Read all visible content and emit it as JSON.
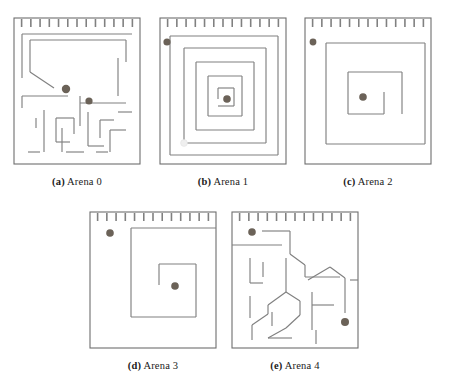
{
  "figure": {
    "background_color": "#ffffff",
    "wall_color": "#808080",
    "border_color": "#6e6e6e",
    "agent_color": "#6b6258",
    "goal_color": "#efefef",
    "rows": [
      {
        "cells": [
          "arena0",
          "arena1",
          "arena2"
        ]
      },
      {
        "cells": [
          "arena3",
          "arena4"
        ]
      }
    ]
  },
  "arenas": [
    {
      "id": "arena0",
      "caption_tag": "(a)",
      "caption_text": "Arena 0",
      "x": 14,
      "y": 18,
      "width": 126,
      "height": 146,
      "teeth_count": 13,
      "agents": [
        {
          "name": "agent-marker",
          "cx": 66,
          "cy": 89,
          "r": 4.2
        },
        {
          "name": "agent-marker",
          "cx": 89,
          "cy": 101,
          "r": 3.6
        }
      ],
      "walls": [
        "M 22 34 L 132 34",
        "M 22 34 L 22 78",
        "M 30 40 L 126 40",
        "M 30 40 L 30 72",
        "M 126 40 L 126 62",
        "M 118 58 L 118 96",
        "M 30 72 L 54 88",
        "M 22 96 L 68 96",
        "M 22 96 L 22 108",
        "M 80 103 L 126 103",
        "M 80 96 L 80 126",
        "M 44 110 L 44 152",
        "M 36 118 L 36 128",
        "M 56 118 L 74 118",
        "M 74 118 L 74 134",
        "M 56 118 L 56 142",
        "M 56 142 L 70 142",
        "M 62 128 L 62 152",
        "M 88 112 L 88 146",
        "M 88 146 L 104 146",
        "M 100 120 L 100 138",
        "M 100 120 L 114 120",
        "M 110 130 L 126 130",
        "M 110 130 L 110 152",
        "M 118 112 L 132 112",
        "M 28 152 L 40 152",
        "M 66 152 L 84 152",
        "M 96 152 L 108 152"
      ]
    },
    {
      "id": "arena1",
      "caption_tag": "(b)",
      "caption_text": "Arena 1",
      "x": 160,
      "y": 18,
      "width": 126,
      "height": 146,
      "teeth_count": 13,
      "agents": [
        {
          "name": "agent-marker",
          "cx": 167,
          "cy": 42,
          "r": 3.6
        },
        {
          "name": "agent-marker",
          "cx": 227,
          "cy": 99,
          "r": 3.8
        }
      ],
      "goal": {
        "cx": 184,
        "cy": 143,
        "r": 3.4
      },
      "walls": [
        "M 170 36 L 278 36",
        "M 278 36 L 278 155",
        "M 170 155 L 278 155",
        "M 170 36 L 170 155",
        "M 184 48 L 266 48",
        "M 266 48 L 266 143",
        "M 184 143 L 266 143",
        "M 184 48 L 184 143",
        "M 196 62 L 254 62",
        "M 254 62 L 254 130",
        "M 196 130 L 254 130",
        "M 196 62 L 196 130",
        "M 208 76 L 242 76",
        "M 242 76 L 242 116",
        "M 208 116 L 242 116",
        "M 208 76 L 208 116",
        "M 218 88 L 234 88",
        "M 234 88 L 234 106",
        "M 218 106 L 234 106",
        "M 218 88 L 218 99"
      ]
    },
    {
      "id": "arena2",
      "caption_tag": "(c)",
      "caption_text": "Arena 2",
      "x": 305,
      "y": 18,
      "width": 126,
      "height": 146,
      "teeth_count": 13,
      "agents": [
        {
          "name": "agent-marker",
          "cx": 313,
          "cy": 42,
          "r": 3.4
        },
        {
          "name": "agent-marker",
          "cx": 363,
          "cy": 97,
          "r": 3.8
        }
      ],
      "walls": [
        "M 326 43 L 425 43",
        "M 425 43 L 425 144",
        "M 326 144 L 425 144",
        "M 326 43 L 326 144",
        "M 348 72 L 402 72",
        "M 402 72 L 402 114",
        "M 348 114 L 384 114",
        "M 348 72 L 348 114",
        "M 384 92 L 384 114"
      ]
    },
    {
      "id": "arena3",
      "caption_tag": "(d)",
      "caption_text": "Arena 3",
      "x": 90,
      "y": 212,
      "width": 126,
      "height": 136,
      "teeth_count": 13,
      "agents": [
        {
          "name": "agent-marker",
          "cx": 110,
          "cy": 233,
          "r": 3.8
        },
        {
          "name": "agent-marker",
          "cx": 175,
          "cy": 286,
          "r": 3.8
        }
      ],
      "walls": [
        "M 131 228 L 216 228",
        "M 131 228 L 131 317",
        "M 131 317 L 196 317",
        "M 196 317 L 196 264",
        "M 159 264 L 196 264",
        "M 159 264 L 159 285"
      ]
    },
    {
      "id": "arena4",
      "caption_tag": "(e)",
      "caption_text": "Arena 4",
      "x": 232,
      "y": 212,
      "width": 126,
      "height": 136,
      "teeth_count": 13,
      "agents": [
        {
          "name": "agent-marker",
          "cx": 252,
          "cy": 232,
          "r": 3.8
        },
        {
          "name": "agent-marker",
          "cx": 345,
          "cy": 322,
          "r": 4.0
        }
      ],
      "walls": [
        "M 262 231 L 290 231",
        "M 290 231 L 290 254",
        "M 290 254 L 305 265",
        "M 305 265 L 305 277",
        "M 305 277 L 340 277",
        "M 232 245 L 282 245",
        "M 250 258 L 250 283",
        "M 263 262 L 263 277",
        "M 250 283 L 263 283",
        "M 250 296 L 250 318",
        "M 286 258 L 286 292",
        "M 286 292 L 268 305",
        "M 268 305 L 268 314",
        "M 268 314 L 252 325",
        "M 252 325 L 252 340",
        "M 272 312 L 272 326",
        "M 286 292 L 300 301",
        "M 300 301 L 300 315",
        "M 300 315 L 286 328",
        "M 286 328 L 268 338",
        "M 268 338 L 292 338",
        "M 308 280 L 330 267",
        "M 330 267 L 345 278",
        "M 345 278 L 345 313",
        "M 312 292 L 312 330",
        "M 312 305 L 334 305",
        "M 350 280 L 358 280",
        "M 316 330 L 316 344"
      ]
    }
  ]
}
